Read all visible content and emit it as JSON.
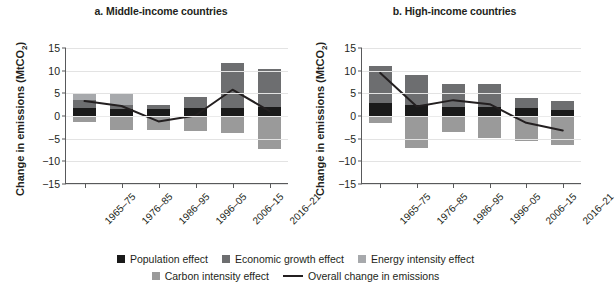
{
  "figure": {
    "ylabel_prefix": "Change in emissions (MtCO",
    "ylabel_sub": "2",
    "ylabel_suffix": ")"
  },
  "legend": {
    "items": [
      {
        "label": "Population effect",
        "color": "#1a1a1a",
        "type": "swatch"
      },
      {
        "label": "Economic growth effect",
        "color": "#6d6e70",
        "type": "swatch"
      },
      {
        "label": "Energy intensity effect",
        "color": "#a7a9ac",
        "type": "swatch"
      },
      {
        "label": "Carbon intensity effect",
        "color": "#9a9a9a",
        "type": "swatch"
      },
      {
        "label": "Overall change in emissions",
        "color": "#231f20",
        "type": "line"
      }
    ]
  },
  "chart_data": [
    {
      "type": "bar",
      "id": "middle-income",
      "title": "a. Middle-income countries",
      "xlabel": "",
      "ylabel": "Change in emissions (MtCO2)",
      "ylim": [
        -15,
        15
      ],
      "yticks": [
        15,
        10,
        5,
        0,
        -5,
        -10,
        -15
      ],
      "grid": true,
      "legend_position": "bottom",
      "categories": [
        "1965–75",
        "1976–85",
        "1986–95",
        "1996–05",
        "2006–15",
        "2016–21"
      ],
      "series": [
        {
          "name": "Population effect",
          "color": "#1a1a1a",
          "values": [
            1.7,
            1.5,
            1.5,
            1.7,
            1.7,
            1.9
          ]
        },
        {
          "name": "Economic growth effect",
          "color": "#6d6e70",
          "values": [
            1.8,
            1.0,
            0.9,
            2.4,
            10.0,
            8.4
          ]
        },
        {
          "name": "Energy intensity effect",
          "color": "#a7a9ac",
          "values": [
            1.5,
            2.5,
            0.0,
            0.0,
            0.0,
            0.0
          ]
        },
        {
          "name": "Carbon intensity effect",
          "color": "#9a9a9a",
          "values": [
            -1.4,
            -3.1,
            -3.0,
            -3.2,
            -3.8,
            -7.2
          ]
        }
      ],
      "overall": {
        "name": "Overall change in emissions",
        "color": "#231f20",
        "values": [
          3.3,
          2.2,
          -1.2,
          0.1,
          5.8,
          1.1
        ]
      }
    },
    {
      "type": "bar",
      "id": "high-income",
      "title": "b. High-income countries",
      "xlabel": "",
      "ylabel": "Change in emissions (MtCO2)",
      "ylim": [
        -15,
        15
      ],
      "yticks": [
        15,
        10,
        5,
        0,
        -5,
        -10,
        -15
      ],
      "grid": true,
      "legend_position": "bottom",
      "categories": [
        "1965–75",
        "1976–85",
        "1986–95",
        "1996–05",
        "2006–15",
        "2016–21"
      ],
      "series": [
        {
          "name": "Population effect",
          "color": "#1a1a1a",
          "values": [
            2.9,
            2.4,
            1.9,
            1.9,
            1.7,
            1.4
          ]
        },
        {
          "name": "Economic growth effect",
          "color": "#6d6e70",
          "values": [
            8.1,
            6.6,
            5.1,
            5.1,
            2.3,
            2.0
          ]
        },
        {
          "name": "Energy intensity effect",
          "color": "#a7a9ac",
          "values": [
            0.0,
            0.0,
            0.0,
            0.0,
            0.0,
            0.0
          ]
        },
        {
          "name": "Carbon intensity effect",
          "color": "#9a9a9a",
          "values": [
            -1.5,
            -7.0,
            -3.5,
            -4.8,
            -5.5,
            -6.5
          ]
        }
      ],
      "overall": {
        "name": "Overall change in emissions",
        "color": "#231f20",
        "values": [
          9.5,
          2.1,
          3.5,
          2.6,
          -1.5,
          -3.2
        ]
      }
    }
  ]
}
